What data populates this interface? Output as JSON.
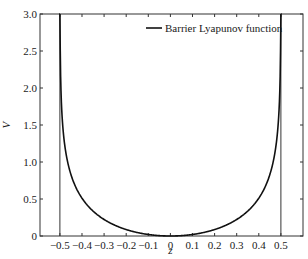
{
  "chart_data": {
    "type": "line",
    "title": "",
    "xlabel": "z",
    "ylabel": "V",
    "xlim": [
      -0.59,
      0.6
    ],
    "ylim": [
      0,
      3.0
    ],
    "xticks": [
      -0.5,
      -0.4,
      -0.3,
      -0.2,
      -0.1,
      0,
      0.1,
      0.2,
      0.3,
      0.4,
      0.5
    ],
    "xtick_labels": [
      "−0.5",
      "−0.4",
      "−0.3",
      "−0.2",
      "−0.1",
      "0",
      "0.1",
      "0.2",
      "0.3",
      "0.4",
      "0.5"
    ],
    "yticks": [
      0,
      0.5,
      1.0,
      1.5,
      2.0,
      2.5,
      3.0
    ],
    "ytick_labels": [
      "0",
      "0.5",
      "1.0",
      "1.5",
      "2.0",
      "2.5",
      "3.0"
    ],
    "grid": false,
    "legend": {
      "position": "top-right",
      "entries": [
        "Barrier Lyapunov function"
      ]
    },
    "series": [
      {
        "name": "Barrier Lyapunov function",
        "function": "V = 0.5*ln(kb^2/(kb^2 - z^2))",
        "kb": 0.5,
        "x": [
          -0.4995,
          -0.499,
          -0.495,
          -0.49,
          -0.48,
          -0.47,
          -0.45,
          -0.42,
          -0.4,
          -0.35,
          -0.3,
          -0.25,
          -0.2,
          -0.15,
          -0.1,
          -0.05,
          0,
          0.05,
          0.1,
          0.15,
          0.2,
          0.25,
          0.3,
          0.35,
          0.4,
          0.42,
          0.45,
          0.47,
          0.48,
          0.49,
          0.495,
          0.499,
          0.4995
        ],
        "values": [
          3.45,
          2.76,
          1.96,
          1.62,
          1.29,
          1.09,
          0.83,
          0.6,
          0.51,
          0.34,
          0.22,
          0.14,
          0.09,
          0.05,
          0.02,
          0.005,
          0,
          0.005,
          0.02,
          0.05,
          0.09,
          0.14,
          0.22,
          0.34,
          0.51,
          0.6,
          0.83,
          1.09,
          1.29,
          1.62,
          1.96,
          2.76,
          3.45
        ]
      }
    ],
    "vertical_lines": [
      -0.5,
      0.5
    ]
  }
}
